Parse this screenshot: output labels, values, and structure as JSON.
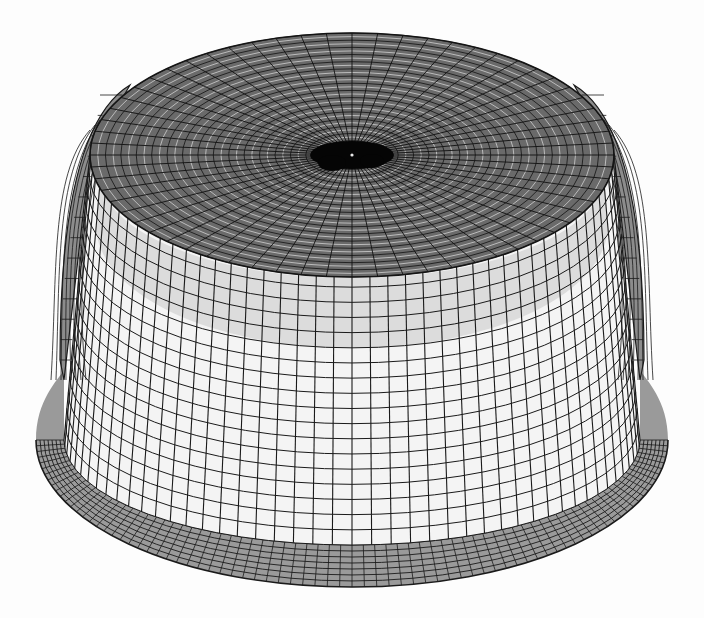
{
  "figure": {
    "subject": "finite element wireframe mesh of a flanged cup / dome shell",
    "background_color": "#fdfdfd",
    "line_color": "#1a1a1a",
    "wall_fill_color": "#f4f4f4",
    "flange_fill_color": "#9a9a9a",
    "top_fill_color": "#6a6a6a",
    "geometry": {
      "center_x": 352,
      "top_center_y": 155,
      "dome_top_y": 34,
      "top_rx": 262,
      "top_ry": 122,
      "top_front_edge_y": 268,
      "shoulder_left_x": 92,
      "shoulder_right_x": 612,
      "flange_start_y": 380,
      "flange_left_x": 36,
      "flange_right_x": 668,
      "flange_mid_y": 440,
      "flange_inner_bottom_y": 545,
      "bottom_y": 587
    },
    "mesh": {
      "top_rings": 34,
      "top_radials": 64,
      "wall_columns": 46,
      "wall_rows": 18,
      "flange_rings": 7,
      "flange_radials": 80
    }
  }
}
